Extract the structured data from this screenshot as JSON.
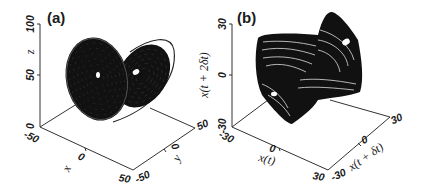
{
  "chart_data": [
    {
      "type": "scatter",
      "subtype": "3d-trajectory",
      "panel_label": "(a)",
      "title": "",
      "description": "Lorenz-type chaotic attractor, two-lobe butterfly",
      "axes": {
        "x": {
          "label": "x",
          "range": [
            -50,
            50
          ],
          "ticks": [
            "-50",
            "0",
            "50"
          ]
        },
        "y": {
          "label": "y",
          "range": [
            -50,
            50
          ],
          "ticks": [
            "-50",
            "0",
            "50"
          ]
        },
        "z": {
          "label": "z",
          "range": [
            0,
            100
          ],
          "ticks": [
            "0",
            "50",
            "100"
          ]
        }
      },
      "lobes": [
        {
          "name": "left",
          "center_x": -12,
          "center_y": -10,
          "center_z": 48
        },
        {
          "name": "right",
          "center_x": 10,
          "center_y": 12,
          "center_z": 52
        }
      ],
      "grid": false,
      "color": "#111111"
    },
    {
      "type": "scatter",
      "subtype": "3d-delay-embedding",
      "panel_label": "(b)",
      "title": "",
      "description": "Reconstructed attractor from time-delay embedding",
      "axes": {
        "x": {
          "label": "x(t)",
          "range": [
            -30,
            30
          ],
          "ticks": [
            "-30",
            "0",
            "30"
          ]
        },
        "y": {
          "label": "x(t + δt)",
          "range": [
            -30,
            30
          ],
          "ticks": [
            "-30",
            "0",
            "30"
          ]
        },
        "z": {
          "label": "x(t + 2δt)",
          "range": [
            -30,
            30
          ],
          "ticks": [
            "-30",
            "0",
            "30"
          ]
        }
      },
      "grid": false,
      "color": "#111111"
    }
  ]
}
